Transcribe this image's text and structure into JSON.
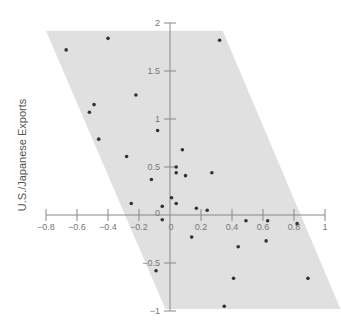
{
  "chart_data": {
    "type": "scatter",
    "title": "",
    "xlabel": "",
    "ylabel": "U.S./Japanese Exports",
    "xlim": [
      -0.8,
      1
    ],
    "ylim": [
      -1,
      2
    ],
    "grid": false,
    "legend": null,
    "x_ticks": [
      -0.8,
      -0.6,
      -0.4,
      -0.2,
      0,
      0.2,
      0.4,
      0.6,
      0.8,
      1
    ],
    "x_tick_labels": [
      "−0.8",
      "−0.6",
      "−0.4",
      "−0.2",
      "0",
      "0.2",
      "0.4",
      "0.6",
      "0.8",
      "1"
    ],
    "y_ticks": [
      -1,
      -0.5,
      0,
      0.5,
      1,
      1.5,
      2
    ],
    "y_tick_labels": [
      "−1",
      "−0.5",
      "0",
      "0.5",
      "1",
      "1.5",
      "2"
    ],
    "shaded_region": {
      "shape": "parallelogram",
      "color": "#e0e0e0",
      "vertices": [
        [
          -0.8,
          1.92
        ],
        [
          0.34,
          1.92
        ],
        [
          1.1,
          -0.98
        ],
        [
          -0.03,
          -0.98
        ]
      ]
    },
    "point_color": "#333333",
    "points": [
      {
        "x": -0.67,
        "y": 1.72
      },
      {
        "x": -0.4,
        "y": 1.84
      },
      {
        "x": 0.32,
        "y": 1.82
      },
      {
        "x": -0.22,
        "y": 1.25
      },
      {
        "x": -0.49,
        "y": 1.15
      },
      {
        "x": -0.52,
        "y": 1.07
      },
      {
        "x": -0.08,
        "y": 0.88
      },
      {
        "x": -0.46,
        "y": 0.79
      },
      {
        "x": -0.28,
        "y": 0.61
      },
      {
        "x": 0.08,
        "y": 0.68
      },
      {
        "x": 0.04,
        "y": 0.5
      },
      {
        "x": 0.04,
        "y": 0.44
      },
      {
        "x": 0.1,
        "y": 0.41
      },
      {
        "x": 0.27,
        "y": 0.44
      },
      {
        "x": -0.12,
        "y": 0.37
      },
      {
        "x": 0.01,
        "y": 0.18
      },
      {
        "x": 0.04,
        "y": 0.12
      },
      {
        "x": -0.25,
        "y": 0.12
      },
      {
        "x": -0.05,
        "y": 0.09
      },
      {
        "x": 0.17,
        "y": 0.07
      },
      {
        "x": 0.24,
        "y": 0.05
      },
      {
        "x": -0.05,
        "y": -0.05
      },
      {
        "x": 0.49,
        "y": -0.06
      },
      {
        "x": 0.63,
        "y": -0.06
      },
      {
        "x": 0.82,
        "y": -0.09
      },
      {
        "x": 0.14,
        "y": -0.23
      },
      {
        "x": 0.62,
        "y": -0.27
      },
      {
        "x": 0.44,
        "y": -0.33
      },
      {
        "x": -0.09,
        "y": -0.58
      },
      {
        "x": 0.41,
        "y": -0.66
      },
      {
        "x": 0.89,
        "y": -0.66
      },
      {
        "x": 0.35,
        "y": -0.95
      }
    ]
  },
  "layout": {
    "origin_px": [
      170,
      215
    ],
    "px_per_unit_x": 155,
    "px_per_unit_y": 96
  }
}
